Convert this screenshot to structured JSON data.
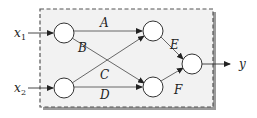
{
  "diagram": {
    "type": "neural-network",
    "inputs": [
      {
        "id": "x1",
        "label": "x",
        "subscript": "1"
      },
      {
        "id": "x2",
        "label": "x",
        "subscript": "2"
      }
    ],
    "output": {
      "id": "y",
      "label": "y"
    },
    "edge_labels": {
      "A": "A",
      "B": "B",
      "C": "C",
      "D": "D",
      "E": "E",
      "F": "F"
    },
    "edges": [
      {
        "from": "in1",
        "to": "h1",
        "label": "A"
      },
      {
        "from": "in1",
        "to": "h2",
        "label": "B"
      },
      {
        "from": "in2",
        "to": "h1",
        "label": "C"
      },
      {
        "from": "in2",
        "to": "h2",
        "label": "D"
      },
      {
        "from": "h1",
        "to": "out",
        "label": "E"
      },
      {
        "from": "h2",
        "to": "out",
        "label": "F"
      }
    ],
    "colors": {
      "box_fill": "#f2f2f2",
      "box_border": "#555555",
      "shadow": "#999999",
      "line": "#333333"
    }
  }
}
